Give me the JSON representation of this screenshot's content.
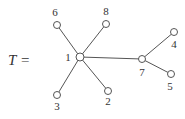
{
  "diagram": {
    "type": "tree",
    "title_symbol": "T",
    "title_equals": "=",
    "colors": {
      "stroke": "#555555",
      "node_fill": "#ffffff",
      "text": "#333333"
    },
    "nodes": [
      {
        "id": "1",
        "label": "1",
        "x": 80,
        "y": 57,
        "lx": 68,
        "ly": 61
      },
      {
        "id": "2",
        "label": "2",
        "x": 108,
        "y": 91,
        "lx": 108,
        "ly": 105
      },
      {
        "id": "3",
        "label": "3",
        "x": 57,
        "y": 95,
        "lx": 57,
        "ly": 110
      },
      {
        "id": "4",
        "label": "4",
        "x": 174,
        "y": 32,
        "lx": 174,
        "ly": 48
      },
      {
        "id": "5",
        "label": "5",
        "x": 171,
        "y": 74,
        "lx": 170,
        "ly": 90
      },
      {
        "id": "6",
        "label": "6",
        "x": 57,
        "y": 25,
        "lx": 55,
        "ly": 16
      },
      {
        "id": "7",
        "label": "7",
        "x": 142,
        "y": 59,
        "lx": 142,
        "ly": 76
      },
      {
        "id": "8",
        "label": "8",
        "x": 106,
        "y": 24,
        "lx": 106,
        "ly": 15
      }
    ],
    "edges": [
      [
        "1",
        "6"
      ],
      [
        "1",
        "8"
      ],
      [
        "1",
        "3"
      ],
      [
        "1",
        "2"
      ],
      [
        "1",
        "7"
      ],
      [
        "7",
        "4"
      ],
      [
        "7",
        "5"
      ]
    ]
  }
}
